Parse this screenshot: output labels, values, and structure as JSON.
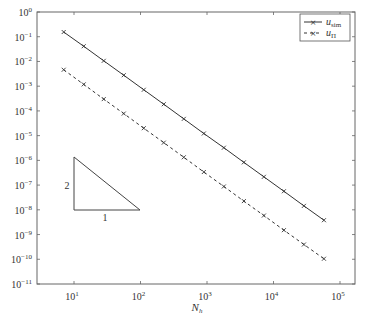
{
  "chart_data": {
    "type": "line",
    "title": "",
    "xlabel": "N_h",
    "ylabel": "",
    "xscale": "log",
    "yscale": "log",
    "xlim": [
      3.5,
      150000
    ],
    "ylim": [
      1e-11,
      1
    ],
    "grid": false,
    "legend_position": "upper right",
    "x_ticks": [
      {
        "base": "10",
        "exp": "1"
      },
      {
        "base": "10",
        "exp": "2"
      },
      {
        "base": "10",
        "exp": "3"
      },
      {
        "base": "10",
        "exp": "4"
      },
      {
        "base": "10",
        "exp": "5"
      }
    ],
    "y_ticks": [
      {
        "base": "10",
        "exp": "0"
      },
      {
        "base": "10",
        "exp": "−1"
      },
      {
        "base": "10",
        "exp": "−2"
      },
      {
        "base": "10",
        "exp": "−3"
      },
      {
        "base": "10",
        "exp": "−4"
      },
      {
        "base": "10",
        "exp": "−5"
      },
      {
        "base": "10",
        "exp": "−6"
      },
      {
        "base": "10",
        "exp": "−7"
      },
      {
        "base": "10",
        "exp": "−8"
      },
      {
        "base": "10",
        "exp": "−9"
      },
      {
        "base": "10",
        "exp": "−10"
      },
      {
        "base": "10",
        "exp": "−11"
      }
    ],
    "x": [
      7,
      14,
      28,
      56,
      112,
      224,
      448,
      896,
      1792,
      3584,
      7168,
      14336,
      28672,
      57344
    ],
    "series": [
      {
        "name": "u_sim",
        "name_base": "u",
        "name_sub": "sim",
        "style": "solid",
        "marker": "x",
        "color": "#333333",
        "values": [
          0.15,
          0.039,
          0.0098,
          0.0025,
          0.00063,
          0.00016,
          4e-05,
          1e-05,
          2.6e-06,
          6.5e-07,
          1.65e-07,
          4.2e-08,
          1.05e-08,
          2.7e-09
        ]
      },
      {
        "name": "u_Π",
        "name_base": "u",
        "name_sub": "Π",
        "style": "dashed",
        "marker": "x",
        "color": "#333333",
        "values": [
          0.0042,
          0.00105,
          0.00026,
          6.6e-05,
          1.65e-05,
          4.2e-06,
          1.05e-06,
          2.6e-07,
          6.6e-08,
          1.65e-08,
          4.2e-09,
          1.05e-09,
          2.7e-10,
          7e-11
        ]
      }
    ],
    "annotations": [
      {
        "type": "slope-triangle",
        "rise_label": "2",
        "run_label": "1"
      }
    ]
  }
}
